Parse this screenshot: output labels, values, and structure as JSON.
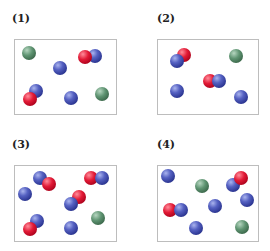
{
  "panels": [
    {
      "label": "(1)",
      "label_pos": [
        12,
        12
      ],
      "box": [
        14,
        39,
        103,
        76
      ],
      "atoms": [
        {
          "color": "green",
          "x": 29,
          "y": 53,
          "z": 1
        },
        {
          "color": "blue",
          "x": 60,
          "y": 68,
          "z": 1
        },
        {
          "color": "blue",
          "x": 95,
          "y": 56,
          "z": 1
        },
        {
          "color": "red",
          "x": 85,
          "y": 57,
          "z": 2
        },
        {
          "color": "blue",
          "x": 36,
          "y": 91,
          "z": 1
        },
        {
          "color": "red",
          "x": 30,
          "y": 99,
          "z": 2
        },
        {
          "color": "blue",
          "x": 71,
          "y": 98,
          "z": 1
        },
        {
          "color": "green",
          "x": 102,
          "y": 94,
          "z": 1
        }
      ]
    },
    {
      "label": "(2)",
      "label_pos": [
        157,
        12
      ],
      "box": [
        157,
        39,
        102,
        76
      ],
      "atoms": [
        {
          "color": "red",
          "x": 184,
          "y": 55,
          "z": 1
        },
        {
          "color": "blue",
          "x": 177,
          "y": 61,
          "z": 2
        },
        {
          "color": "green",
          "x": 236,
          "y": 56,
          "z": 1
        },
        {
          "color": "red",
          "x": 210,
          "y": 81,
          "z": 1
        },
        {
          "color": "blue",
          "x": 219,
          "y": 81,
          "z": 2
        },
        {
          "color": "blue",
          "x": 177,
          "y": 91,
          "z": 1
        },
        {
          "color": "blue",
          "x": 241,
          "y": 97,
          "z": 1
        }
      ]
    },
    {
      "label": "(3)",
      "label_pos": [
        12,
        138
      ],
      "box": [
        14,
        165,
        103,
        77
      ],
      "atoms": [
        {
          "color": "blue",
          "x": 40,
          "y": 178,
          "z": 1
        },
        {
          "color": "red",
          "x": 49,
          "y": 184,
          "z": 2
        },
        {
          "color": "red",
          "x": 91,
          "y": 178,
          "z": 1
        },
        {
          "color": "blue",
          "x": 102,
          "y": 178,
          "z": 2
        },
        {
          "color": "blue",
          "x": 25,
          "y": 194,
          "z": 1
        },
        {
          "color": "red",
          "x": 79,
          "y": 197,
          "z": 1
        },
        {
          "color": "blue",
          "x": 71,
          "y": 204,
          "z": 2
        },
        {
          "color": "blue",
          "x": 37,
          "y": 221,
          "z": 1
        },
        {
          "color": "red",
          "x": 30,
          "y": 229,
          "z": 2
        },
        {
          "color": "blue",
          "x": 71,
          "y": 228,
          "z": 1
        },
        {
          "color": "green",
          "x": 98,
          "y": 218,
          "z": 1
        }
      ]
    },
    {
      "label": "(4)",
      "label_pos": [
        157,
        138
      ],
      "box": [
        157,
        165,
        102,
        77
      ],
      "atoms": [
        {
          "color": "blue",
          "x": 168,
          "y": 176,
          "z": 1
        },
        {
          "color": "green",
          "x": 202,
          "y": 186,
          "z": 1
        },
        {
          "color": "blue",
          "x": 233,
          "y": 185,
          "z": 1
        },
        {
          "color": "red",
          "x": 241,
          "y": 178,
          "z": 2
        },
        {
          "color": "blue",
          "x": 247,
          "y": 200,
          "z": 1
        },
        {
          "color": "red",
          "x": 170,
          "y": 210,
          "z": 1
        },
        {
          "color": "blue",
          "x": 181,
          "y": 210,
          "z": 2
        },
        {
          "color": "blue",
          "x": 215,
          "y": 206,
          "z": 1
        },
        {
          "color": "blue",
          "x": 196,
          "y": 228,
          "z": 1
        },
        {
          "color": "green",
          "x": 242,
          "y": 227,
          "z": 1
        }
      ]
    }
  ],
  "colors": {
    "blue": "#3a44a8",
    "red": "#d4102c",
    "green": "#4f7f5f",
    "box_border": "#bdbdbd"
  }
}
